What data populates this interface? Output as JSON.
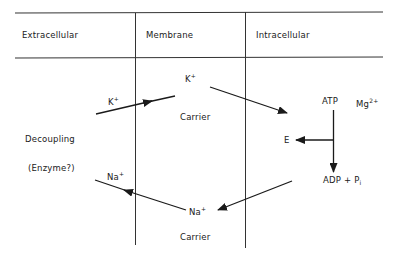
{
  "header": {
    "columns": [
      {
        "label": "Extracellular"
      },
      {
        "label": "Membrane"
      },
      {
        "label": "Intracellular"
      }
    ]
  },
  "extracellular": {
    "decoupling": "Decoupling",
    "enzyme": "(Enzyme?)",
    "k_ion": {
      "base": "K",
      "charge": "+"
    },
    "na_ion": {
      "base": "Na",
      "charge": "+"
    }
  },
  "membrane": {
    "k_ion": {
      "base": "K",
      "charge": "+"
    },
    "k_carrier": "Carrier",
    "na_ion": {
      "base": "Na",
      "charge": "+"
    },
    "na_carrier": "Carrier"
  },
  "intracellular": {
    "atp": "ATP",
    "mg": {
      "base": "Mg",
      "charge": "2+"
    },
    "enzyme_e": "E",
    "products": {
      "adp": "ADP + P",
      "pi_sub": "i"
    }
  },
  "colors": {
    "line": "#1a1a1a",
    "grid": "#333333",
    "background": "#ffffff"
  }
}
